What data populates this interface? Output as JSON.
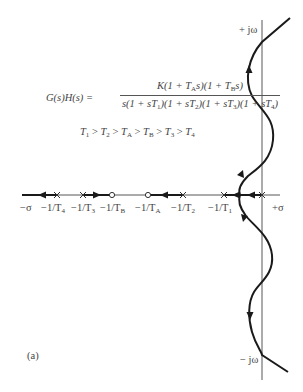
{
  "figure": {
    "label": "(a)",
    "equation": {
      "lhs": "G(s)H(s) =",
      "numerator": "K(1 + T_A s)(1 + T_B s)",
      "denominator": "s(1 + sT_1)(1 + sT_2)(1 + sT_3)(1 + sT_4)"
    },
    "inequality": "T1 > T2 > TA > TB > T3 > T4",
    "axes": {
      "imag_pos": "+ jω",
      "imag_neg": "− jω",
      "real_neg": "−σ",
      "real_pos": "+σ"
    },
    "poles": [
      {
        "label": "−1/T4",
        "x": 57
      },
      {
        "label": "−1/T3",
        "x": 83
      },
      {
        "label": "−1/T2",
        "x": 183
      },
      {
        "label": "−1/T1",
        "x": 224
      },
      {
        "label": "0",
        "x": 262
      }
    ],
    "zeros": [
      {
        "label": "−1/TB",
        "x": 112
      },
      {
        "label": "−1/TA",
        "x": 148
      }
    ],
    "real_axis_labels": {
      "neg_sigma": "−σ",
      "t4": "−1/T",
      "t4_sub": "4",
      "t3": "−1/T",
      "t3_sub": "3",
      "tb": "−1/T",
      "tb_sub": "B",
      "ta": "−1/T",
      "ta_sub": "A",
      "t2": "−1/T",
      "t2_sub": "2",
      "t1": "−1/T",
      "t1_sub": "1",
      "pos_sigma": "+σ"
    },
    "colors": {
      "locus": "#1a1a1a",
      "axis": "#333333",
      "text": "#444444"
    }
  }
}
